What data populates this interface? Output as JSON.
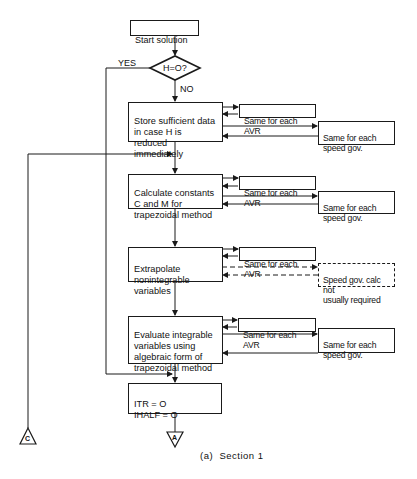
{
  "diagram": {
    "caption": "(a)  Section 1",
    "start": {
      "label": "Start solution"
    },
    "decision": {
      "label": "H=O?",
      "yes_label": "YES",
      "no_label": "NO"
    },
    "steps": [
      {
        "id": "store",
        "label": "Store sufficient data\nin case H is reduced\nimmediately",
        "avr": "Same for each AVR",
        "speed_gov": "Same for each\nspeed gov.",
        "speed_gov_style": "solid"
      },
      {
        "id": "calculate",
        "label": "Calculate constants\nC and M for\ntrapezoidal method",
        "avr": "Same for each AVR",
        "speed_gov": "Same for each\nspeed gov.",
        "speed_gov_style": "solid"
      },
      {
        "id": "extrapolate",
        "label": "Extrapolate\nnonintegrable\nvariables",
        "avr": "Same for each AVR",
        "speed_gov": "Speed gov. calc not\nusually required",
        "speed_gov_style": "dashed"
      },
      {
        "id": "evaluate",
        "label": "Evaluate integrable\nvariables using\nalgebraic form of\ntrapezoidal method",
        "avr": "Same for each AVR",
        "speed_gov": "Same for each\nspeed gov.",
        "speed_gov_style": "solid"
      }
    ],
    "final": {
      "label": "ITR = O\nIHALF = O"
    },
    "connectors": {
      "c": {
        "letter": "C"
      },
      "a": {
        "letter": "A"
      }
    },
    "colors": {
      "line": "#1a1a1a",
      "background": "#ffffff"
    }
  }
}
